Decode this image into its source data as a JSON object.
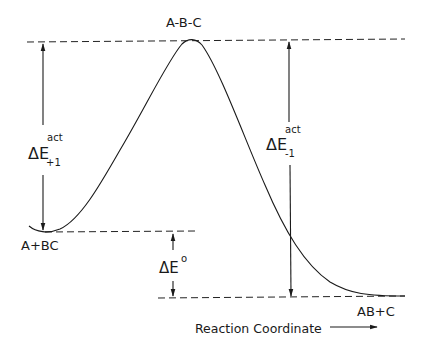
{
  "diagram": {
    "type": "potential-energy-reaction-profile",
    "labels": {
      "transition_state": "A-B-C",
      "reactants": "A+BC",
      "products": "AB+C",
      "x_axis": "Reaction Coordinate",
      "forward_activation": {
        "base": "ΔE",
        "sup": "act",
        "sub": "+1"
      },
      "reverse_activation": {
        "base": "ΔE",
        "sup": "act",
        "sub": "-1"
      },
      "reaction_energy": {
        "base": "ΔE",
        "sup": "o"
      }
    },
    "levels": {
      "transition_state_y": 41,
      "reactants_y": 232,
      "products_y": 298
    },
    "colors": {
      "ink": "#1a1a1a",
      "background": "#ffffff"
    }
  }
}
